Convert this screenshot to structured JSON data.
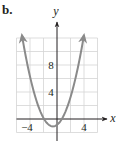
{
  "figure": {
    "part_label": "b."
  },
  "chart_data": {
    "type": "line",
    "title": "",
    "xlabel": "x",
    "ylabel": "y",
    "xlim": [
      -6,
      6
    ],
    "ylim": [
      -2,
      12
    ],
    "grid": true,
    "grid_step": 2,
    "x_ticks_labeled": [
      -4,
      4
    ],
    "x_tick_labels": [
      "−4",
      "4"
    ],
    "y_ticks_labeled": [
      4,
      8
    ],
    "y_tick_labels": [
      "4",
      "8"
    ],
    "series": [
      {
        "name": "parabola",
        "form": "y = a(x - h)^2 + k",
        "a": 0.64,
        "h": -0.6,
        "k": -1.1,
        "vertex": [
          -0.6,
          -1.1
        ],
        "x_intercepts": [
          -1.9,
          0.7
        ],
        "x_range": [
          -5.2,
          4.0
        ],
        "arrows_both_ends": true,
        "color": "#8a8a8a"
      }
    ],
    "colors": {
      "grid": "#d4d4d4",
      "axis": "#231f20",
      "curve": "#8a8a8a"
    }
  }
}
